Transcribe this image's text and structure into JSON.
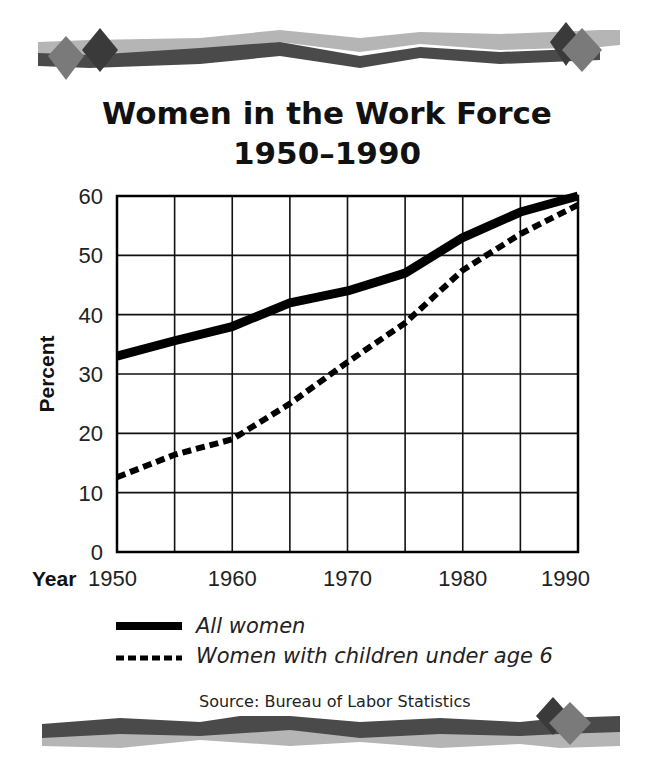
{
  "title": {
    "line1": "Women in the Work Force",
    "line2": "1950–1990"
  },
  "axes": {
    "ylabel": "Percent",
    "xlabel": "Year",
    "y_ticks": [
      "0",
      "10",
      "20",
      "30",
      "40",
      "50",
      "60"
    ],
    "x_ticks": [
      "1950",
      "1960",
      "1970",
      "1980",
      "1990"
    ]
  },
  "legend": {
    "all_women": "All women",
    "women_children": "Women with children under age 6"
  },
  "source": "Source: Bureau of Labor Statistics",
  "colors": {
    "line": "#000000",
    "grid": "#111111",
    "deco_dark": "#4a4a4a",
    "deco_light": "#b5b5b5",
    "diamond_dark": "#3a3a3a",
    "diamond_mid": "#7a7a7a"
  },
  "chart_data": {
    "type": "line",
    "xlabel": "Year",
    "ylabel": "Percent",
    "x": [
      1950,
      1955,
      1960,
      1965,
      1970,
      1975,
      1980,
      1985,
      1990
    ],
    "xlim": [
      1950,
      1990
    ],
    "ylim": [
      0,
      60
    ],
    "x_tick_step": 5,
    "y_tick_step": 10,
    "grid": true,
    "legend_position": "bottom",
    "series": [
      {
        "name": "All women",
        "style": "solid",
        "values": [
          33,
          35.6,
          38,
          42,
          44,
          47,
          53,
          57.3,
          60
        ]
      },
      {
        "name": "Women with children under age 6",
        "style": "dashed",
        "values": [
          12.6,
          16.4,
          19,
          25,
          32,
          38.6,
          47.5,
          53.6,
          58.5
        ]
      }
    ],
    "source": "Source: Bureau of Labor Statistics"
  }
}
